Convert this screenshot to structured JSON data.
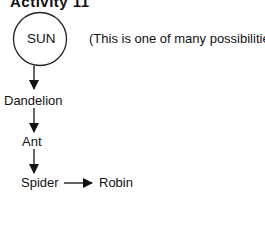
{
  "title": "Activity 11",
  "note": "(This is one of many possibilities.)",
  "nodes": {
    "sun": "SUN",
    "dandelion": "Dandelion",
    "ant": "Ant",
    "spider": "Spider",
    "robin": "Robin"
  },
  "edges": [
    {
      "from": "SUN",
      "to": "Dandelion"
    },
    {
      "from": "Dandelion",
      "to": "Ant"
    },
    {
      "from": "Ant",
      "to": "Spider"
    },
    {
      "from": "Spider",
      "to": "Robin"
    }
  ]
}
